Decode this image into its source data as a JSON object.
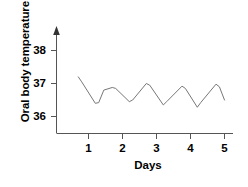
{
  "chart_data": {
    "type": "line",
    "title": "",
    "subtitle": "",
    "xlabel": "Days",
    "ylabel": "Oral body temperature (°C)",
    "xlim": [
      0.5,
      5.2
    ],
    "ylim": [
      35.5,
      38.4
    ],
    "xticks": [
      1,
      2,
      3,
      4,
      5
    ],
    "xtick_labels": [
      "1",
      "2",
      "3",
      "4",
      "5"
    ],
    "yticks": [
      36,
      37,
      38
    ],
    "ytick_labels": [
      "36",
      "37",
      "38"
    ],
    "grid": false,
    "legend": null,
    "axis_style": {
      "y_axis_arrow": true,
      "x_axis_arrow": false,
      "line_color": "#555555",
      "series_color": "#777777"
    },
    "series": [
      {
        "name": "Oral body temperature",
        "color": "#777777",
        "x": [
          0.7,
          0.8,
          1.2,
          1.3,
          1.45,
          1.7,
          1.8,
          2.2,
          2.3,
          2.7,
          2.8,
          3.2,
          3.3,
          3.75,
          3.85,
          4.2,
          4.3,
          4.75,
          4.85,
          5.0
        ],
        "y": [
          37.2,
          37.05,
          36.4,
          36.42,
          36.8,
          36.88,
          36.85,
          36.45,
          36.5,
          37.0,
          36.95,
          36.35,
          36.45,
          36.92,
          36.85,
          36.28,
          36.42,
          36.98,
          36.9,
          36.5
        ]
      }
    ],
    "annotations": []
  },
  "axis": {
    "x_tick_label_1": "1",
    "x_tick_label_2": "2",
    "x_tick_label_3": "3",
    "x_tick_label_4": "4",
    "x_tick_label_5": "5",
    "y_tick_label_36": "36",
    "y_tick_label_37": "37",
    "y_tick_label_38": "38",
    "x_axis_title": "Days",
    "y_axis_title": "Oral body temperature (°C)"
  }
}
